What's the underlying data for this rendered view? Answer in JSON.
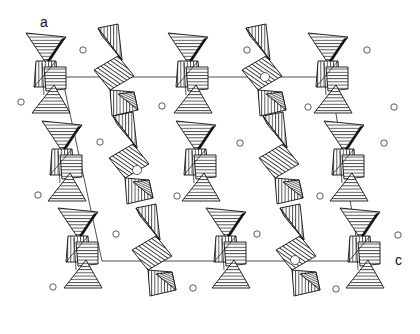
{
  "figure": {
    "type": "crystal-structure-polyhedral-projection",
    "axis_labels": {
      "a": "a",
      "c": "c"
    },
    "unit_cell": {
      "top_left": [
        62,
        77
      ],
      "top_right": [
        330,
        77
      ],
      "bottom_left": [
        102,
        261
      ],
      "bottom_right": [
        360,
        261
      ]
    },
    "columns": [
      {
        "name": "column-1",
        "type": "tetrahedra-octahedra-chain",
        "x": 62
      },
      {
        "name": "column-2",
        "type": "zigzag-tetrahedral-chain",
        "x": 130
      },
      {
        "name": "column-3",
        "type": "tetrahedra-octahedra-chain",
        "x": 205
      },
      {
        "name": "column-4",
        "type": "zigzag-tetrahedral-chain",
        "x": 272
      },
      {
        "name": "column-5",
        "type": "tetrahedra-octahedra-chain",
        "x": 340
      }
    ],
    "ions": [
      [
        83,
        50
      ],
      [
        21,
        102
      ],
      [
        115,
        106
      ],
      [
        247,
        50
      ],
      [
        394,
        107
      ],
      [
        162,
        106
      ],
      [
        308,
        107
      ],
      [
        38,
        195
      ],
      [
        100,
        142
      ],
      [
        174,
        198
      ],
      [
        240,
        143
      ],
      [
        329,
        196
      ],
      [
        384,
        143
      ],
      [
        115,
        234
      ],
      [
        53,
        287
      ],
      [
        196,
        234
      ],
      [
        259,
        290
      ],
      [
        337,
        234
      ],
      [
        398,
        235
      ],
      [
        336,
        289
      ],
      [
        137,
        125
      ]
    ]
  }
}
